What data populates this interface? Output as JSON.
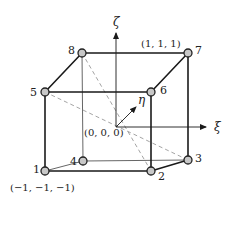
{
  "diagram": {
    "axes": {
      "xi": "ξ",
      "eta": "η",
      "zeta": "ζ"
    },
    "origin_label": "(0, 0, 0)",
    "corner_labels": {
      "node1": "(−1, −1, −1)",
      "node7": "(1, 1, 1)"
    },
    "nodes": [
      {
        "id": "1",
        "label": "1"
      },
      {
        "id": "2",
        "label": "2"
      },
      {
        "id": "3",
        "label": "3"
      },
      {
        "id": "4",
        "label": "4"
      },
      {
        "id": "5",
        "label": "5"
      },
      {
        "id": "6",
        "label": "6"
      },
      {
        "id": "7",
        "label": "7"
      },
      {
        "id": "8",
        "label": "8"
      }
    ],
    "colors": {
      "edge": "#1a1a1a",
      "hidden_edge": "#555555",
      "dashed": "#999999",
      "node_fill": "#c8c8c8",
      "node_stroke": "#222222"
    }
  }
}
